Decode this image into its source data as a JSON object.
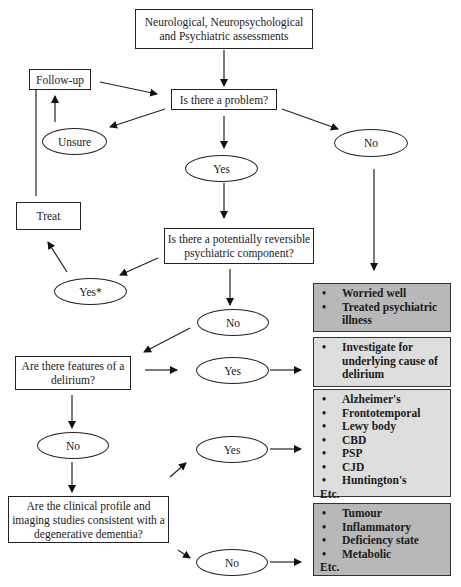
{
  "flowchart": {
    "start": "Neurological, Neuropsychological and Psychiatric assessments",
    "q_problem": "Is there a problem?",
    "follow_up": "Follow-up",
    "unsure": "Unsure",
    "problem_yes": "Yes",
    "problem_no": "No",
    "treat": "Treat",
    "q_psychiatric": "Is there a potentially reversible psychiatric component?",
    "psychiatric_yes": "Yes*",
    "psychiatric_no": "No",
    "q_delirium": "Are there features of a delirium?",
    "delirium_yes": "Yes",
    "delirium_no": "No",
    "q_degenerative": "Are the clinical profile and imaging studies consistent with a degenerative dementia?",
    "degenerative_yes": "Yes",
    "degenerative_no": "No",
    "outcomes": {
      "worried_well": [
        "Worried well",
        "Treated psychiatric illness"
      ],
      "delirium": [
        "Investigate for underlying cause of delirium"
      ],
      "degenerative": [
        "Alzheimer's",
        "Frontotemporal",
        "Lewy body",
        "CBD",
        "PSP",
        "CJD",
        "Huntington's"
      ],
      "degenerative_etc": "Etc.",
      "other": [
        "Tumour",
        "Inflammatory",
        "Deficiency state",
        "Metabolic"
      ],
      "other_etc": "Etc."
    }
  }
}
